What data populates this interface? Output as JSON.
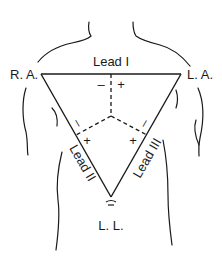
{
  "diagram": {
    "electrodes": {
      "right_arm": "R. A.",
      "left_arm": "L. A.",
      "left_leg": "L. L."
    },
    "leads": {
      "lead1": "Lead I",
      "lead2": "Lead II",
      "lead3": "Lead III"
    },
    "polarity": {
      "lead1_neg": "–",
      "lead1_pos": "+",
      "lead2_neg": "–",
      "lead2_pos": "+",
      "lead3_neg": "–",
      "lead3_pos": "+"
    },
    "colors": {
      "line": "#1a1a1a",
      "background": "#ffffff"
    }
  }
}
